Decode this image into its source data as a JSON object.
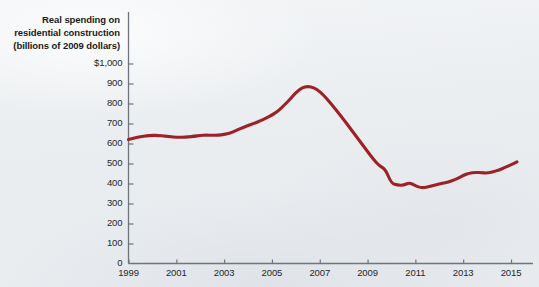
{
  "figure": {
    "caption_lines": [
      "Real spending on",
      "residential construction",
      "(billions of 2009 dollars)"
    ],
    "background_color": "#eef0f2",
    "line_color": "#9c2227",
    "axis_color": "#6e767c"
  },
  "chart_data": {
    "type": "line",
    "title": "Real spending on residential construction (billions of 2009 dollars)",
    "xlabel": "",
    "ylabel": "Real spending on residential construction (billions of 2009 dollars)",
    "xlim": [
      1999,
      2015.5
    ],
    "ylim": [
      0,
      1000
    ],
    "grid": false,
    "legend": null,
    "y_ticks": [
      0,
      100,
      200,
      300,
      400,
      500,
      600,
      700,
      800,
      900,
      1000
    ],
    "y_tick_labels": [
      "0",
      "100",
      "200",
      "300",
      "400",
      "500",
      "600",
      "700",
      "800",
      "900",
      "$1,000"
    ],
    "x_ticks": [
      1999,
      2001,
      2003,
      2005,
      2007,
      2009,
      2011,
      2013,
      2015
    ],
    "x_tick_labels": [
      "1999",
      "2001",
      "2003",
      "2005",
      "2007",
      "2009",
      "2011",
      "2013",
      "2015"
    ],
    "series": [
      {
        "name": "Real residential construction spending",
        "color": "#9c2227",
        "x": [
          1999.0,
          1999.25,
          1999.5,
          1999.75,
          2000.0,
          2000.25,
          2000.5,
          2000.75,
          2001.0,
          2001.25,
          2001.5,
          2001.75,
          2002.0,
          2002.25,
          2002.5,
          2002.75,
          2003.0,
          2003.25,
          2003.5,
          2003.75,
          2004.0,
          2004.25,
          2004.5,
          2004.75,
          2005.0,
          2005.25,
          2005.5,
          2005.75,
          2006.0,
          2006.25,
          2006.5,
          2006.75,
          2007.0,
          2007.25,
          2007.5,
          2007.75,
          2008.0,
          2008.25,
          2008.5,
          2008.75,
          2009.0,
          2009.25,
          2009.5,
          2009.75,
          2010.0,
          2010.25,
          2010.5,
          2010.75,
          2011.0,
          2011.25,
          2011.5,
          2011.75,
          2012.0,
          2012.25,
          2012.5,
          2012.75,
          2013.0,
          2013.25,
          2013.5,
          2013.75,
          2014.0,
          2014.25,
          2014.5,
          2014.75,
          2015.0,
          2015.25
        ],
        "values": [
          620,
          628,
          634,
          638,
          641,
          640,
          637,
          634,
          631,
          631,
          633,
          636,
          640,
          642,
          641,
          641,
          645,
          652,
          665,
          678,
          690,
          700,
          712,
          726,
          742,
          762,
          790,
          820,
          855,
          878,
          886,
          880,
          860,
          830,
          795,
          758,
          720,
          680,
          640,
          600,
          560,
          520,
          488,
          470,
          400,
          392,
          390,
          405,
          388,
          378,
          382,
          390,
          398,
          404,
          412,
          424,
          440,
          452,
          456,
          454,
          452,
          458,
          468,
          480,
          494,
          508
        ]
      }
    ],
    "annotations": []
  },
  "axis_caption": {
    "line1": "Real spending on",
    "line2": "residential construction",
    "line3": "(billions of 2009 dollars)"
  }
}
